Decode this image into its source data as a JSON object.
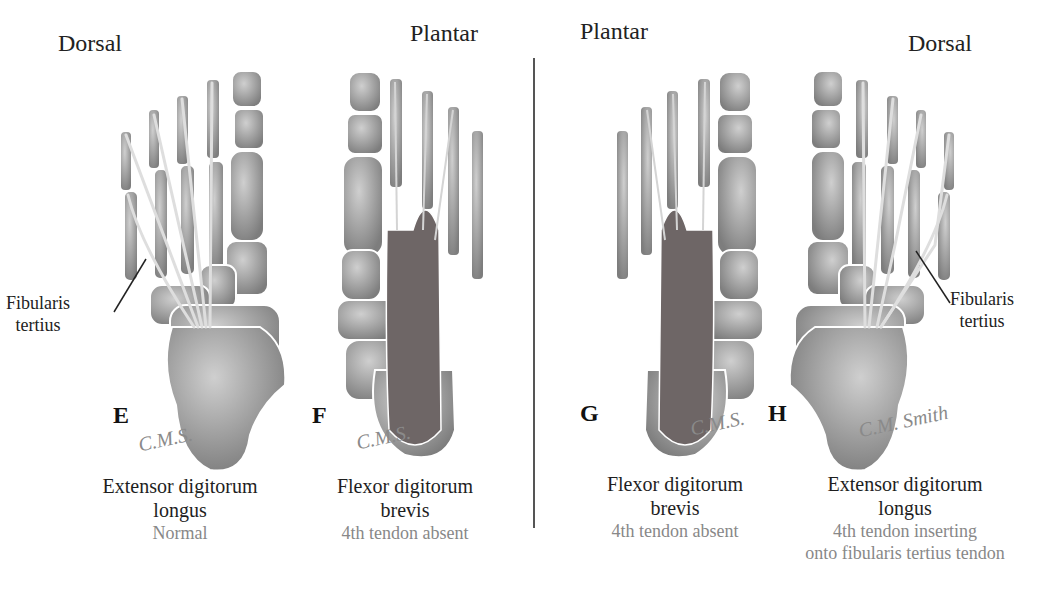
{
  "panels": [
    {
      "id": "E",
      "view": "Dorsal",
      "muscle_line1": "Extensor digitorum",
      "muscle_line2": "longus",
      "note_line1": "Normal",
      "note_line2": "",
      "signature": "C.M.S."
    },
    {
      "id": "F",
      "view": "Plantar",
      "muscle_line1": "Flexor digitorum",
      "muscle_line2": "brevis",
      "note_line1": "4th tendon absent",
      "note_line2": "",
      "signature": "C.M.S."
    },
    {
      "id": "G",
      "view": "Plantar",
      "muscle_line1": "Flexor digitorum",
      "muscle_line2": "brevis",
      "note_line1": "4th tendon absent",
      "note_line2": "",
      "signature": "C.M.S."
    },
    {
      "id": "H",
      "view": "Dorsal",
      "muscle_line1": "Extensor digitorum",
      "muscle_line2": "longus",
      "note_line1": "4th tendon inserting",
      "note_line2": "onto fibularis tertius tendon",
      "signature": "C.M. Smith"
    }
  ],
  "callouts": {
    "left": {
      "line1": "Fibularis",
      "line2": "tertius"
    },
    "right": {
      "line1": "Fibularis",
      "line2": "tertius"
    }
  },
  "colors": {
    "bone": "#b9b9b9",
    "bone_dark": "#8c8c8c",
    "muscle": "#7a6a6a",
    "tendon": "#d8d8d8",
    "note_text": "#888888"
  }
}
